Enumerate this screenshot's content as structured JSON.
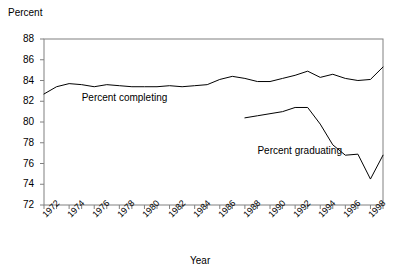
{
  "chart_data": {
    "type": "line",
    "title": "",
    "xlabel": "Year",
    "ylabel": "Percent",
    "ylim": [
      72,
      88
    ],
    "xlim": [
      1972,
      1999
    ],
    "yticks": [
      72,
      74,
      76,
      78,
      80,
      82,
      84,
      86,
      88
    ],
    "xticks": [
      1972,
      1974,
      1976,
      1978,
      1980,
      1982,
      1984,
      1986,
      1988,
      1990,
      1992,
      1994,
      1996,
      1998
    ],
    "xtick_labels": [
      "1972",
      "1974",
      "1976",
      "1978",
      "1980",
      "1982",
      "1984",
      "1986",
      "1988",
      "1990",
      "1992",
      "1994",
      "1996",
      "1998"
    ],
    "ytick_labels": [
      "72",
      "74",
      "76",
      "78",
      "80",
      "82",
      "84",
      "86",
      "88"
    ],
    "grid": false,
    "legend_position": "inline-annotation",
    "line_color": "#000000",
    "frame_color": "#808080",
    "series": [
      {
        "name": "Percent completing",
        "x": [
          1972,
          1973,
          1974,
          1975,
          1976,
          1977,
          1978,
          1979,
          1980,
          1981,
          1982,
          1983,
          1984,
          1985,
          1986,
          1987,
          1988,
          1989,
          1990,
          1991,
          1992,
          1993,
          1994,
          1995,
          1996,
          1997,
          1998,
          1999
        ],
        "values": [
          82.7,
          83.4,
          83.7,
          83.6,
          83.4,
          83.6,
          83.5,
          83.4,
          83.4,
          83.4,
          83.5,
          83.4,
          83.5,
          83.6,
          84.1,
          84.4,
          84.2,
          83.9,
          83.9,
          84.2,
          84.5,
          84.9,
          84.3,
          84.6,
          84.2,
          84.0,
          84.1,
          85.3
        ],
        "label_text": "Percent completing",
        "label_x": 1975,
        "label_y": 82.3
      },
      {
        "name": "Percent graduating",
        "x": [
          1988,
          1989,
          1990,
          1991,
          1992,
          1993,
          1994,
          1995,
          1996,
          1997,
          1998,
          1999
        ],
        "values": [
          80.4,
          80.6,
          80.8,
          81.0,
          81.4,
          81.4,
          79.8,
          77.8,
          76.8,
          76.9,
          74.5,
          76.8
        ],
        "label_text": "Percent graduating",
        "label_x": 1989,
        "label_y": 77.2
      }
    ]
  }
}
